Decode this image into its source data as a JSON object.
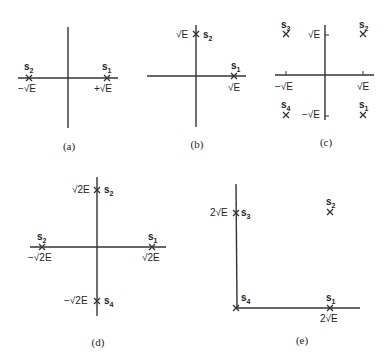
{
  "figure": {
    "panels": [
      {
        "caption": "(a)",
        "points": [
          {
            "name": "s1",
            "sub": "1",
            "value_label": "+√E",
            "coords": [
              "+√E",
              "0"
            ]
          },
          {
            "name": "s2",
            "sub": "2",
            "value_label": "−√E",
            "coords": [
              "−√E",
              "0"
            ]
          }
        ]
      },
      {
        "caption": "(b)",
        "points": [
          {
            "name": "s1",
            "sub": "1",
            "value_label": "√E",
            "coords": [
              "√E",
              "0"
            ]
          },
          {
            "name": "s2",
            "sub": "2",
            "value_label": "√E",
            "coords": [
              "0",
              "√E"
            ]
          }
        ]
      },
      {
        "caption": "(c)",
        "ticks": {
          "x_neg": "−√E",
          "x_pos": "√E",
          "y_pos": "√E",
          "y_neg": "−√E"
        },
        "points": [
          {
            "name": "s1",
            "sub": "1",
            "coords": [
              "√E",
              "−√E"
            ]
          },
          {
            "name": "s2",
            "sub": "2",
            "coords": [
              "√E",
              "√E"
            ]
          },
          {
            "name": "s3",
            "sub": "3",
            "coords": [
              "−√E",
              "√E"
            ]
          },
          {
            "name": "s4",
            "sub": "4",
            "coords": [
              "−√E",
              "−√E"
            ]
          }
        ]
      },
      {
        "caption": "(d)",
        "points": [
          {
            "name": "s1",
            "sub": "1",
            "value_label": "√2E",
            "coords": [
              "√2E",
              "0"
            ]
          },
          {
            "name": "s2",
            "sub": "2",
            "value_label": "√2E",
            "coords": [
              "0",
              "√2E"
            ]
          },
          {
            "name": "s2",
            "sub": "2",
            "value_label": "−√2E",
            "coords": [
              "−√2E",
              "0"
            ]
          },
          {
            "name": "s4",
            "sub": "4",
            "value_label": "−√2E",
            "coords": [
              "0",
              "−√2E"
            ]
          }
        ]
      },
      {
        "caption": "(e)",
        "points": [
          {
            "name": "s1",
            "sub": "1",
            "value_label": "2√E",
            "coords": [
              "2√E",
              "0"
            ]
          },
          {
            "name": "s2",
            "sub": "2",
            "coords": [
              "2√E",
              "2√E"
            ]
          },
          {
            "name": "s3",
            "sub": "3",
            "value_label": "2√E",
            "coords": [
              "0",
              "2√E"
            ]
          },
          {
            "name": "s4",
            "sub": "4",
            "coords": [
              "0",
              "0"
            ]
          }
        ]
      }
    ],
    "signal_letter": "s"
  }
}
